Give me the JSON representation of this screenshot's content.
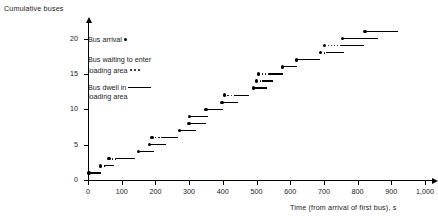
{
  "chart_data": {
    "type": "scatter",
    "title": "",
    "ylabel": "Cumulative buses",
    "xlabel": "Time (from arrival of first bus), s",
    "xlim": [
      0,
      1000
    ],
    "ylim": [
      0,
      21.5
    ],
    "xticks": [
      0,
      100,
      200,
      300,
      400,
      500,
      600,
      700,
      800,
      900,
      1000
    ],
    "xtick_labels": [
      "0",
      "100",
      "200",
      "300",
      "400",
      "500",
      "600",
      "700",
      "800",
      "900",
      "1,000"
    ],
    "yticks": [
      0,
      5,
      10,
      15,
      20
    ],
    "ytick_labels": [
      "0",
      "5",
      "10",
      "15",
      "20"
    ],
    "grid": false,
    "legend_position": "upper-left-inside",
    "series": [
      {
        "name": "Bus arrival",
        "marker": "dot"
      },
      {
        "name": "Bus waiting to enter loading area",
        "marker": "dotted-line"
      },
      {
        "name": "Bus dwell in loading area",
        "marker": "solid-line"
      }
    ],
    "points": [
      {
        "n": 1,
        "arrival": 3,
        "wait_end": 3,
        "dwell_end": 40
      },
      {
        "n": 2,
        "arrival": 38,
        "wait_end": 48,
        "dwell_end": 78
      },
      {
        "n": 3,
        "arrival": 62,
        "wait_end": 84,
        "dwell_end": 140
      },
      {
        "n": 4,
        "arrival": 150,
        "wait_end": 150,
        "dwell_end": 196
      },
      {
        "n": 5,
        "arrival": 182,
        "wait_end": 182,
        "dwell_end": 232
      },
      {
        "n": 6,
        "arrival": 190,
        "wait_end": 218,
        "dwell_end": 268
      },
      {
        "n": 7,
        "arrival": 272,
        "wait_end": 272,
        "dwell_end": 320
      },
      {
        "n": 8,
        "arrival": 300,
        "wait_end": 300,
        "dwell_end": 350
      },
      {
        "n": 9,
        "arrival": 302,
        "wait_end": 302,
        "dwell_end": 356
      },
      {
        "n": 10,
        "arrival": 350,
        "wait_end": 350,
        "dwell_end": 400
      },
      {
        "n": 11,
        "arrival": 398,
        "wait_end": 398,
        "dwell_end": 446
      },
      {
        "n": 12,
        "arrival": 405,
        "wait_end": 432,
        "dwell_end": 478
      },
      {
        "n": 13,
        "arrival": 492,
        "wait_end": 492,
        "dwell_end": 530
      },
      {
        "n": 14,
        "arrival": 500,
        "wait_end": 516,
        "dwell_end": 548
      },
      {
        "n": 15,
        "arrival": 506,
        "wait_end": 538,
        "dwell_end": 580
      },
      {
        "n": 16,
        "arrival": 578,
        "wait_end": 578,
        "dwell_end": 620
      },
      {
        "n": 17,
        "arrival": 618,
        "wait_end": 618,
        "dwell_end": 688
      },
      {
        "n": 18,
        "arrival": 690,
        "wait_end": 706,
        "dwell_end": 760
      },
      {
        "n": 19,
        "arrival": 702,
        "wait_end": 752,
        "dwell_end": 820
      },
      {
        "n": 20,
        "arrival": 756,
        "wait_end": 756,
        "dwell_end": 860
      },
      {
        "n": 21,
        "arrival": 822,
        "wait_end": 822,
        "dwell_end": 920
      }
    ]
  },
  "legend": {
    "arrival": "Bus arrival",
    "waiting_line1": "Bus waiting to enter",
    "waiting_line2": "loading area",
    "dwell_line1": "Bus dwell in",
    "dwell_line2": "loading area"
  }
}
